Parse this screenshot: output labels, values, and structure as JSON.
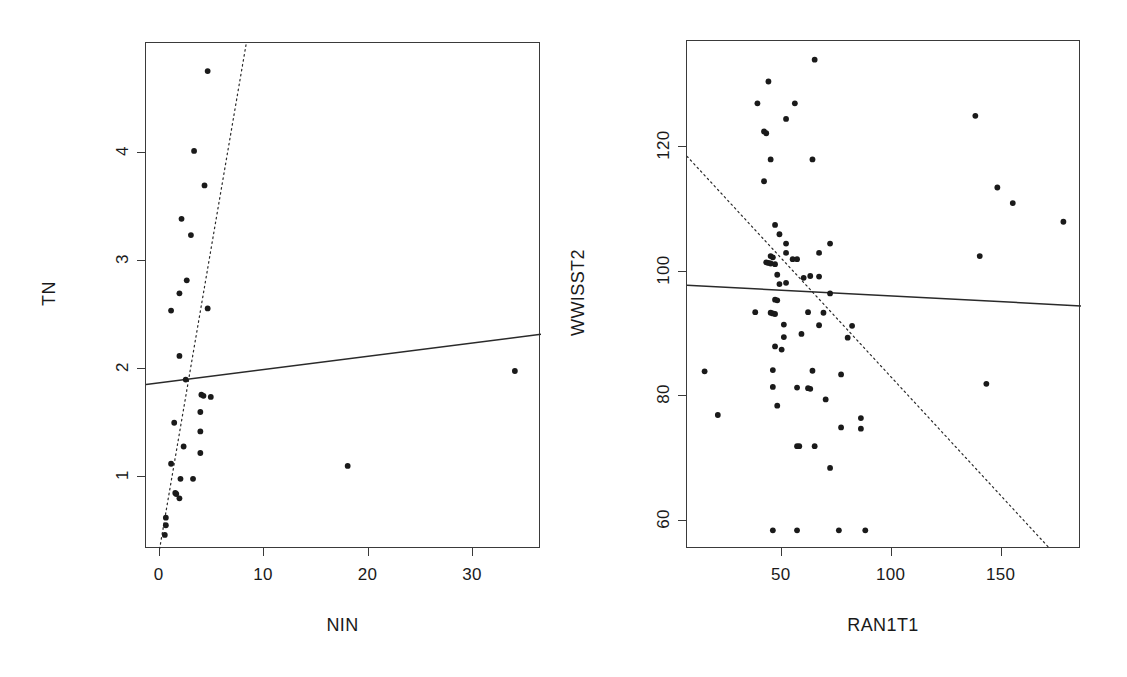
{
  "figure": {
    "background": "#ffffff",
    "foreground": "#1a1a1a",
    "panel_count": 2
  },
  "chart_data": [
    {
      "id": "left",
      "type": "scatter",
      "title": "",
      "xlabel": "NIN",
      "ylabel": "TN",
      "xlim": [
        -1.3,
        36.5
      ],
      "ylim": [
        0.33,
        5.02
      ],
      "xticks": [
        0,
        10,
        20,
        30
      ],
      "xticklabels": [
        "0",
        "10",
        "20",
        "30"
      ],
      "yticks": [
        1,
        2,
        3,
        4
      ],
      "yticklabels": [
        "1",
        "2",
        "3",
        "4"
      ],
      "grid": false,
      "legend": null,
      "point_color": "#1a1a1a",
      "point_size": 4.6,
      "points": [
        {
          "x": 4.6,
          "y": 4.76
        },
        {
          "x": 3.3,
          "y": 4.02
        },
        {
          "x": 4.3,
          "y": 3.7
        },
        {
          "x": 2.1,
          "y": 3.39
        },
        {
          "x": 3.0,
          "y": 3.24
        },
        {
          "x": 2.6,
          "y": 2.82
        },
        {
          "x": 1.9,
          "y": 2.7
        },
        {
          "x": 1.1,
          "y": 2.54
        },
        {
          "x": 4.6,
          "y": 2.56
        },
        {
          "x": 1.9,
          "y": 2.12
        },
        {
          "x": 2.5,
          "y": 1.9
        },
        {
          "x": 4.0,
          "y": 1.76
        },
        {
          "x": 4.2,
          "y": 1.75
        },
        {
          "x": 4.9,
          "y": 1.74
        },
        {
          "x": 3.9,
          "y": 1.6
        },
        {
          "x": 1.4,
          "y": 1.5
        },
        {
          "x": 3.9,
          "y": 1.42
        },
        {
          "x": 2.3,
          "y": 1.28
        },
        {
          "x": 3.9,
          "y": 1.22
        },
        {
          "x": 1.1,
          "y": 1.12
        },
        {
          "x": 18.0,
          "y": 1.1
        },
        {
          "x": 2.0,
          "y": 0.98
        },
        {
          "x": 3.2,
          "y": 0.98
        },
        {
          "x": 1.5,
          "y": 0.85
        },
        {
          "x": 1.6,
          "y": 0.84
        },
        {
          "x": 1.9,
          "y": 0.8
        },
        {
          "x": 0.6,
          "y": 0.62
        },
        {
          "x": 0.6,
          "y": 0.55
        },
        {
          "x": 0.5,
          "y": 0.46
        },
        {
          "x": 34.0,
          "y": 1.98
        }
      ],
      "lines": [
        {
          "name": "solid-fit",
          "style": "solid",
          "x0": -1.3,
          "y0": 1.855,
          "x1": 36.5,
          "y1": 2.32
        },
        {
          "name": "dotted-fit",
          "style": "dotted",
          "x0": 0.0,
          "y0": 0.33,
          "x1": 8.3,
          "y1": 5.02
        }
      ]
    },
    {
      "id": "right",
      "type": "scatter",
      "title": "",
      "xlabel": "RAN1T1",
      "ylabel": "WWISST2",
      "xlim": [
        7,
        186
      ],
      "ylim": [
        55.5,
        137.0
      ],
      "xticks": [
        50,
        100,
        150
      ],
      "xticklabels": [
        "50",
        "100",
        "150"
      ],
      "yticks": [
        60,
        80,
        100,
        120
      ],
      "yticklabels": [
        "60",
        "80",
        "100",
        "120"
      ],
      "grid": false,
      "legend": null,
      "point_color": "#1a1a1a",
      "point_size": 4.6,
      "points": [
        {
          "x": 65,
          "y": 134.0
        },
        {
          "x": 44,
          "y": 130.5
        },
        {
          "x": 39,
          "y": 127.0
        },
        {
          "x": 56,
          "y": 127.0
        },
        {
          "x": 52,
          "y": 124.5
        },
        {
          "x": 42,
          "y": 122.5
        },
        {
          "x": 43,
          "y": 122.2
        },
        {
          "x": 45,
          "y": 118.0
        },
        {
          "x": 64,
          "y": 118.0
        },
        {
          "x": 42,
          "y": 114.5
        },
        {
          "x": 47,
          "y": 107.5
        },
        {
          "x": 49,
          "y": 106.0
        },
        {
          "x": 52,
          "y": 104.5
        },
        {
          "x": 52,
          "y": 103.0
        },
        {
          "x": 45,
          "y": 102.5
        },
        {
          "x": 46,
          "y": 102.3
        },
        {
          "x": 43,
          "y": 101.5
        },
        {
          "x": 44,
          "y": 101.4
        },
        {
          "x": 45,
          "y": 101.3
        },
        {
          "x": 47,
          "y": 101.2
        },
        {
          "x": 55,
          "y": 102.0
        },
        {
          "x": 57,
          "y": 102.0
        },
        {
          "x": 67,
          "y": 103.0
        },
        {
          "x": 72,
          "y": 104.5
        },
        {
          "x": 48,
          "y": 99.5
        },
        {
          "x": 60,
          "y": 99.0
        },
        {
          "x": 63,
          "y": 99.3
        },
        {
          "x": 49,
          "y": 98.0
        },
        {
          "x": 52,
          "y": 98.2
        },
        {
          "x": 67,
          "y": 99.2
        },
        {
          "x": 72,
          "y": 96.5
        },
        {
          "x": 47,
          "y": 95.5
        },
        {
          "x": 48,
          "y": 95.4
        },
        {
          "x": 38,
          "y": 93.5
        },
        {
          "x": 45,
          "y": 93.4
        },
        {
          "x": 46,
          "y": 93.3
        },
        {
          "x": 47,
          "y": 93.2
        },
        {
          "x": 62,
          "y": 93.5
        },
        {
          "x": 69,
          "y": 93.4
        },
        {
          "x": 51,
          "y": 91.5
        },
        {
          "x": 67,
          "y": 91.4
        },
        {
          "x": 82,
          "y": 91.3
        },
        {
          "x": 59,
          "y": 90.0
        },
        {
          "x": 51,
          "y": 89.5
        },
        {
          "x": 80,
          "y": 89.4
        },
        {
          "x": 47,
          "y": 88.0
        },
        {
          "x": 50,
          "y": 87.5
        },
        {
          "x": 15,
          "y": 84.0
        },
        {
          "x": 46,
          "y": 84.2
        },
        {
          "x": 64,
          "y": 84.1
        },
        {
          "x": 77,
          "y": 83.5
        },
        {
          "x": 46,
          "y": 81.5
        },
        {
          "x": 57,
          "y": 81.4
        },
        {
          "x": 62,
          "y": 81.3
        },
        {
          "x": 63,
          "y": 81.2
        },
        {
          "x": 143,
          "y": 82.0
        },
        {
          "x": 70,
          "y": 79.5
        },
        {
          "x": 48,
          "y": 78.5
        },
        {
          "x": 21,
          "y": 77.0
        },
        {
          "x": 86,
          "y": 76.5
        },
        {
          "x": 77,
          "y": 75.0
        },
        {
          "x": 86,
          "y": 74.8
        },
        {
          "x": 57,
          "y": 72.0
        },
        {
          "x": 58,
          "y": 72.0
        },
        {
          "x": 65,
          "y": 72.0
        },
        {
          "x": 72,
          "y": 68.5
        },
        {
          "x": 46,
          "y": 58.5
        },
        {
          "x": 57,
          "y": 58.5
        },
        {
          "x": 76,
          "y": 58.5
        },
        {
          "x": 88,
          "y": 58.5
        },
        {
          "x": 138,
          "y": 125.0
        },
        {
          "x": 148,
          "y": 113.5
        },
        {
          "x": 155,
          "y": 111.0
        },
        {
          "x": 178,
          "y": 108.0
        },
        {
          "x": 140,
          "y": 102.5
        }
      ],
      "lines": [
        {
          "name": "solid-fit",
          "style": "solid",
          "x0": 7,
          "y0": 97.8,
          "x1": 186,
          "y1": 94.5
        },
        {
          "name": "dotted-fit",
          "style": "dotted",
          "x0": 7,
          "y0": 118.5,
          "x1": 172,
          "y1": 55.5
        }
      ]
    }
  ]
}
